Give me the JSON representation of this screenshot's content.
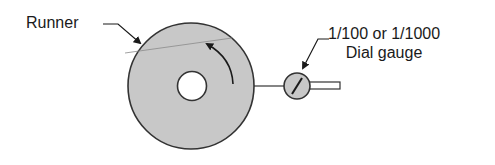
{
  "diagram": {
    "labels": {
      "runner": "Runner",
      "gauge_line1": "1/100 or 1/1000",
      "gauge_line2": "Dial gauge"
    },
    "colors": {
      "runner_fill": "#c8c8c8",
      "outline": "#333333",
      "background": "#ffffff"
    },
    "elements": [
      {
        "id": "runner-disc",
        "shape": "circle",
        "description": "Runner disc with central hub hole"
      },
      {
        "id": "rotation-arrow",
        "shape": "arc-arrow",
        "description": "Counter-clockwise rotation direction arrow"
      },
      {
        "id": "dial-gauge",
        "shape": "circle",
        "description": "Dial gauge with needle and stem"
      }
    ]
  }
}
